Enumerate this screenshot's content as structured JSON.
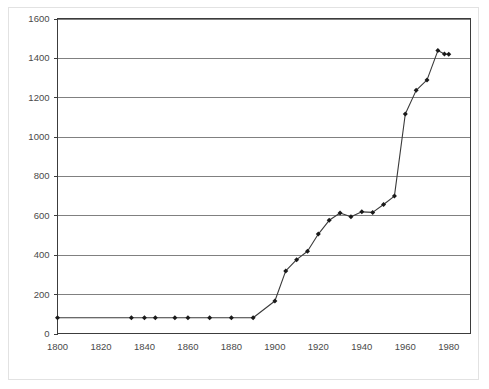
{
  "chart_data": {
    "type": "line",
    "title": "",
    "subtitle": "",
    "xlabel": "",
    "ylabel": "",
    "xlim": [
      1800,
      1990
    ],
    "ylim": [
      0,
      1600
    ],
    "grid": true,
    "grid_axis": "y",
    "legend": "none",
    "marker": "diamond",
    "x_ticks": [
      1800,
      1820,
      1840,
      1860,
      1880,
      1900,
      1920,
      1940,
      1960,
      1980
    ],
    "x_tick_labels": [
      "1800",
      "1820",
      "1840",
      "1860",
      "1880",
      "1900",
      "1920",
      "1940",
      "1960",
      "1980"
    ],
    "y_ticks": [
      0,
      200,
      400,
      600,
      800,
      1000,
      1200,
      1400,
      1600
    ],
    "y_tick_labels": [
      "0",
      "200",
      "400",
      "600",
      "800",
      "1000",
      "1200",
      "1400",
      "1600"
    ],
    "x": [
      1800,
      1834,
      1840,
      1845,
      1854,
      1860,
      1870,
      1880,
      1890,
      1900,
      1905,
      1910,
      1915,
      1920,
      1925,
      1930,
      1935,
      1940,
      1945,
      1950,
      1955,
      1960,
      1965,
      1970,
      1975,
      1978,
      1980
    ],
    "values": [
      80,
      80,
      80,
      80,
      80,
      80,
      80,
      80,
      80,
      165,
      318,
      375,
      418,
      505,
      575,
      612,
      593,
      618,
      615,
      655,
      698,
      1115,
      1235,
      1288,
      1437,
      1420,
      1418
    ],
    "series": [
      {
        "name": "series-1",
        "color": "#3a3a3a",
        "points": [
          [
            1800,
            80
          ],
          [
            1834,
            80
          ],
          [
            1840,
            80
          ],
          [
            1845,
            80
          ],
          [
            1854,
            80
          ],
          [
            1860,
            80
          ],
          [
            1870,
            80
          ],
          [
            1880,
            80
          ],
          [
            1890,
            80
          ],
          [
            1900,
            165
          ],
          [
            1905,
            318
          ],
          [
            1910,
            375
          ],
          [
            1915,
            418
          ],
          [
            1920,
            505
          ],
          [
            1925,
            575
          ],
          [
            1930,
            612
          ],
          [
            1935,
            593
          ],
          [
            1940,
            618
          ],
          [
            1945,
            615
          ],
          [
            1950,
            655
          ],
          [
            1955,
            698
          ],
          [
            1960,
            1115
          ],
          [
            1965,
            1235
          ],
          [
            1970,
            1288
          ],
          [
            1975,
            1437
          ],
          [
            1978,
            1420
          ],
          [
            1980,
            1418
          ]
        ]
      }
    ]
  },
  "colors": {
    "background": "#ffffff",
    "frame_border": "#e2e2e2",
    "axis": "#3c3c3c",
    "gridline": "#808080",
    "line": "#3a3a3a",
    "marker": "#1a1a1a",
    "tick_text": "#4a4a4a"
  }
}
